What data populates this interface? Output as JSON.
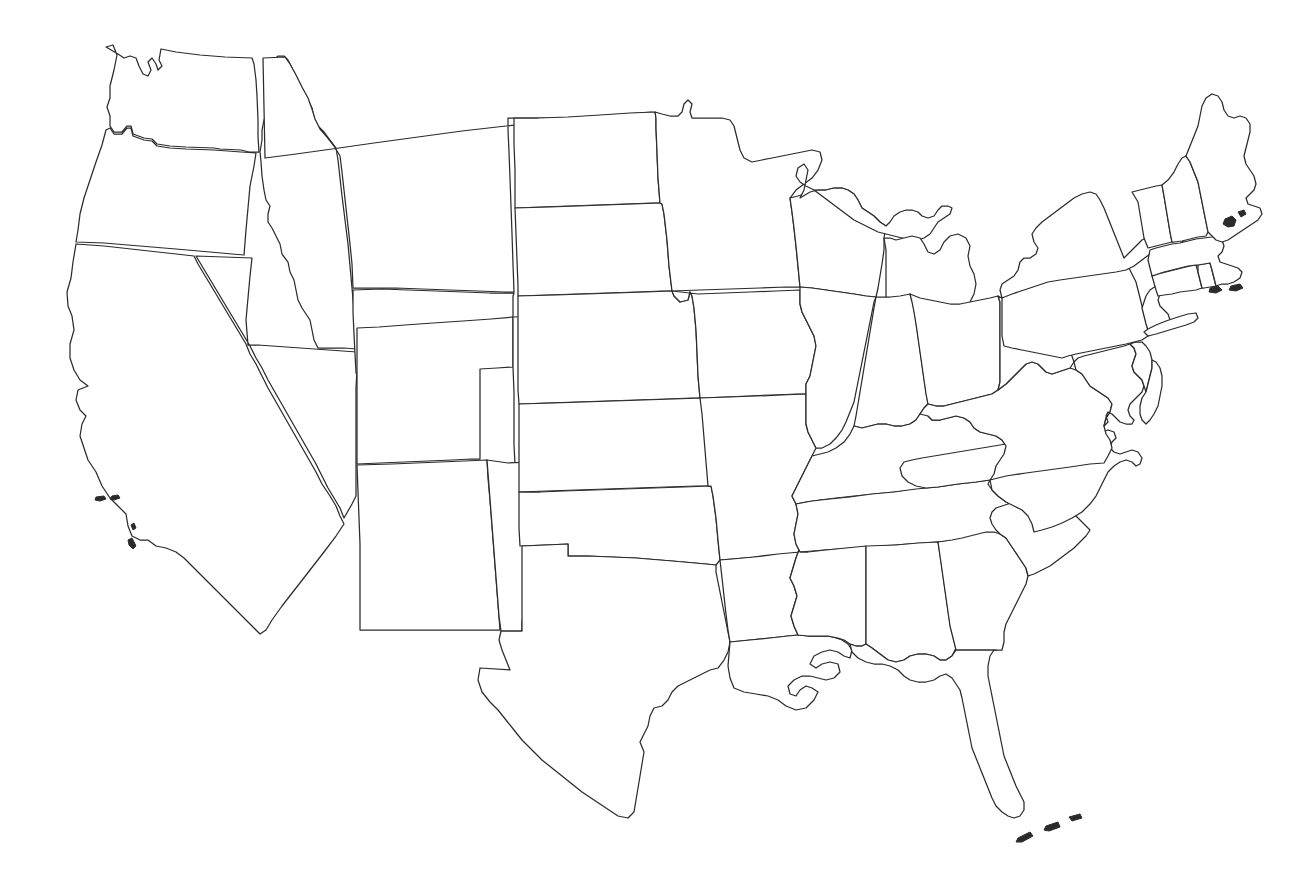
{
  "document": {
    "kind": "blank-outline-map",
    "region": "Contiguous United States",
    "background_color": "#ffffff",
    "outline_color": "#2b2b2b",
    "fill_color": "#ffffff",
    "stroke_width_px": 1.25,
    "labels_present": false,
    "legend_present": false,
    "graticule_present": false,
    "width_px": 1306,
    "height_px": 882
  },
  "map_data": {
    "type": "choropleth-blank",
    "projection_hint": "albers-usa-like",
    "state_count": 49,
    "notes": "No text labels, no legend, no axis ticks; pure white fill with thin dark outlines.",
    "states": [
      {
        "code": "WA",
        "name": "Washington"
      },
      {
        "code": "OR",
        "name": "Oregon"
      },
      {
        "code": "CA",
        "name": "California"
      },
      {
        "code": "NV",
        "name": "Nevada"
      },
      {
        "code": "ID",
        "name": "Idaho"
      },
      {
        "code": "MT",
        "name": "Montana"
      },
      {
        "code": "WY",
        "name": "Wyoming"
      },
      {
        "code": "UT",
        "name": "Utah"
      },
      {
        "code": "AZ",
        "name": "Arizona"
      },
      {
        "code": "CO",
        "name": "Colorado"
      },
      {
        "code": "NM",
        "name": "New Mexico"
      },
      {
        "code": "ND",
        "name": "North Dakota"
      },
      {
        "code": "SD",
        "name": "South Dakota"
      },
      {
        "code": "NE",
        "name": "Nebraska"
      },
      {
        "code": "KS",
        "name": "Kansas"
      },
      {
        "code": "OK",
        "name": "Oklahoma"
      },
      {
        "code": "TX",
        "name": "Texas"
      },
      {
        "code": "MN",
        "name": "Minnesota"
      },
      {
        "code": "IA",
        "name": "Iowa"
      },
      {
        "code": "MO",
        "name": "Missouri"
      },
      {
        "code": "AR",
        "name": "Arkansas"
      },
      {
        "code": "LA",
        "name": "Louisiana"
      },
      {
        "code": "WI",
        "name": "Wisconsin"
      },
      {
        "code": "IL",
        "name": "Illinois"
      },
      {
        "code": "MI",
        "name": "Michigan"
      },
      {
        "code": "IN",
        "name": "Indiana"
      },
      {
        "code": "OH",
        "name": "Ohio"
      },
      {
        "code": "KY",
        "name": "Kentucky"
      },
      {
        "code": "TN",
        "name": "Tennessee"
      },
      {
        "code": "MS",
        "name": "Mississippi"
      },
      {
        "code": "AL",
        "name": "Alabama"
      },
      {
        "code": "GA",
        "name": "Georgia"
      },
      {
        "code": "FL",
        "name": "Florida"
      },
      {
        "code": "SC",
        "name": "South Carolina"
      },
      {
        "code": "NC",
        "name": "North Carolina"
      },
      {
        "code": "VA",
        "name": "Virginia"
      },
      {
        "code": "WV",
        "name": "West Virginia"
      },
      {
        "code": "MD",
        "name": "Maryland"
      },
      {
        "code": "DE",
        "name": "Delaware"
      },
      {
        "code": "PA",
        "name": "Pennsylvania"
      },
      {
        "code": "NJ",
        "name": "New Jersey"
      },
      {
        "code": "NY",
        "name": "New York"
      },
      {
        "code": "CT",
        "name": "Connecticut"
      },
      {
        "code": "RI",
        "name": "Rhode Island"
      },
      {
        "code": "MA",
        "name": "Massachusetts"
      },
      {
        "code": "VT",
        "name": "Vermont"
      },
      {
        "code": "NH",
        "name": "New Hampshire"
      },
      {
        "code": "ME",
        "name": "Maine"
      },
      {
        "code": "DC",
        "name": "District of Columbia"
      }
    ],
    "islands": [
      {
        "name": "Channel Islands"
      },
      {
        "name": "Florida Keys"
      },
      {
        "name": "Marthas Vineyard"
      },
      {
        "name": "Nantucket"
      },
      {
        "name": "Mount Desert Island"
      }
    ]
  }
}
